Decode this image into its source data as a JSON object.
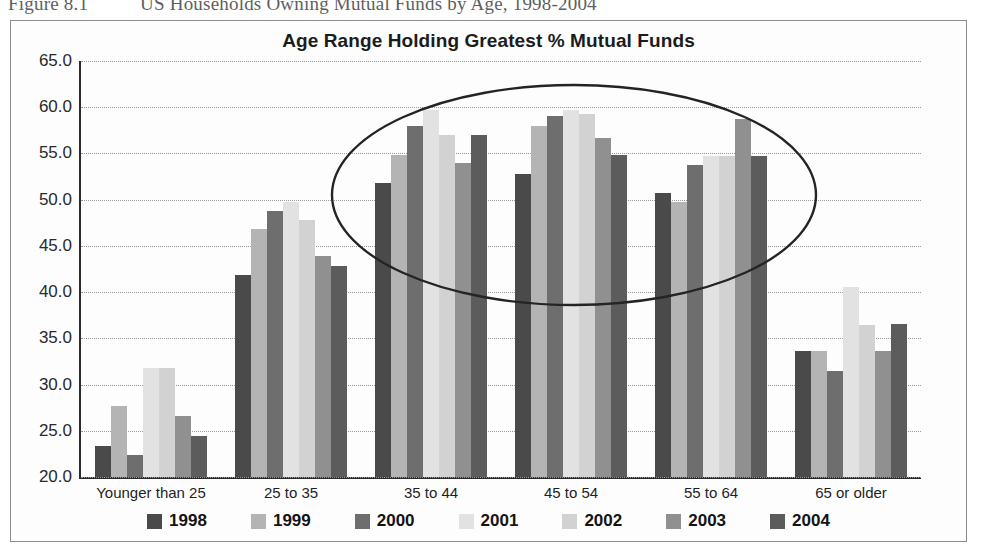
{
  "caption": {
    "number": "Figure 8.1",
    "text": "US Households Owning Mutual Funds by Age, 1998-2004"
  },
  "chart_frame": {
    "title": "Age Range Holding Greatest % Mutual Funds"
  },
  "annotation": {
    "name": "highlight-ellipse",
    "description": "Hand-drawn ellipse circling the 35 to 44, 45 to 54 and 55 to 64 age groups",
    "color": "#242424"
  },
  "legend": {
    "position": "bottom",
    "items": [
      {
        "label": "1998",
        "color": "#4a4a4a"
      },
      {
        "label": "1999",
        "color": "#b4b4b4"
      },
      {
        "label": "2000",
        "color": "#6e6e6e"
      },
      {
        "label": "2001",
        "color": "#e2e2e2"
      },
      {
        "label": "2002",
        "color": "#d2d2d2"
      },
      {
        "label": "2003",
        "color": "#909090"
      },
      {
        "label": "2004",
        "color": "#5c5c5c"
      }
    ]
  },
  "chart_data": {
    "type": "bar",
    "title": "Age Range Holding Greatest % Mutual Funds",
    "xlabel": "",
    "ylabel": "",
    "ylim": [
      20.0,
      65.0
    ],
    "ytick_step": 5.0,
    "ytick_labels": [
      "20.0",
      "25.0",
      "30.0",
      "35.0",
      "40.0",
      "45.0",
      "50.0",
      "55.0",
      "60.0",
      "65.0"
    ],
    "grid": true,
    "grid_style": "dotted horizontal",
    "legend_position": "bottom",
    "categories": [
      "Younger than 25",
      "25 to 35",
      "35 to 44",
      "45 to 54",
      "55 to 64",
      "65 or older"
    ],
    "series": [
      {
        "name": "1998",
        "color": "#4a4a4a",
        "values": [
          23.4,
          41.9,
          51.8,
          52.8,
          50.7,
          33.6
        ]
      },
      {
        "name": "1999",
        "color": "#b4b4b4",
        "values": [
          27.7,
          46.8,
          54.8,
          58.0,
          49.7,
          33.6
        ]
      },
      {
        "name": "2000",
        "color": "#6e6e6e",
        "values": [
          22.4,
          48.8,
          58.0,
          59.0,
          53.8,
          31.5
        ]
      },
      {
        "name": "2001",
        "color": "#e2e2e2",
        "values": [
          31.8,
          49.7,
          59.7,
          59.7,
          54.7,
          40.6
        ]
      },
      {
        "name": "2002",
        "color": "#d2d2d2",
        "values": [
          31.8,
          47.8,
          57.0,
          59.3,
          54.7,
          36.4
        ]
      },
      {
        "name": "2003",
        "color": "#909090",
        "values": [
          26.6,
          43.9,
          54.0,
          56.7,
          58.7,
          33.6
        ]
      },
      {
        "name": "2004",
        "color": "#5c5c5c",
        "values": [
          24.4,
          42.8,
          57.0,
          54.8,
          54.7,
          36.6
        ]
      }
    ]
  }
}
